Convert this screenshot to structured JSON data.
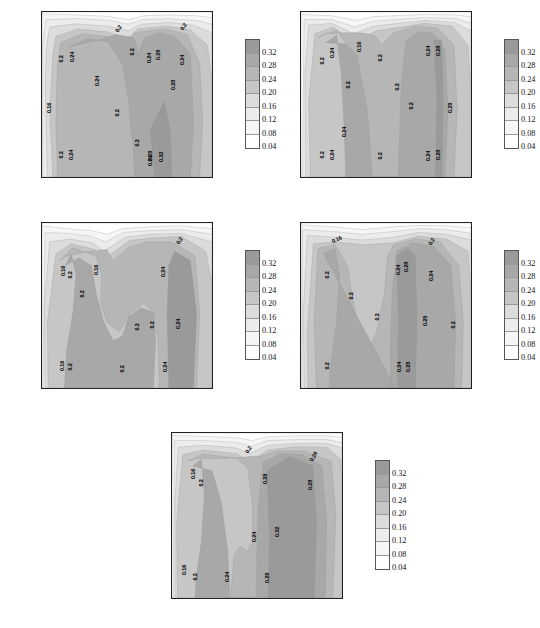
{
  "figure": {
    "panel_count": 5,
    "axis": {
      "ylabel": "土壤深度（cm）",
      "yticks": [
        "-5",
        "-10",
        "-15",
        "-20",
        "-25",
        "-30",
        "-35",
        "-40"
      ],
      "ytick_values": [
        -5,
        -10,
        -15,
        -20,
        -25,
        -30,
        -35,
        -40
      ],
      "xticks": [
        "1",
        "2",
        "3",
        "4",
        "5",
        "6",
        "7",
        "8",
        "9",
        "10",
        "11",
        "12"
      ],
      "xtick_values": [
        1,
        2,
        3,
        4,
        5,
        6,
        7,
        8,
        9,
        10,
        11,
        12
      ]
    },
    "colorbar": {
      "labels": [
        "0.32",
        "0.28",
        "0.24",
        "0.20",
        "0.16",
        "0.12",
        "0.08",
        "0.04"
      ],
      "values": [
        0.32,
        0.28,
        0.24,
        0.2,
        0.16,
        0.12,
        0.08,
        0.04
      ],
      "colors": [
        "#9a9a9a",
        "#a8a8a8",
        "#b6b6b6",
        "#c6c6c6",
        "#dcdcdc",
        "#ececec",
        "#f6f6f6",
        "#ffffff"
      ]
    }
  },
  "chart_data": {
    "type": "heatmap",
    "title": "",
    "xlabel_template": "月份(YYYY年)",
    "ylabel": "土壤深度（cm）",
    "xlim": [
      1,
      12
    ],
    "ylim": [
      -40,
      -5
    ],
    "grid": false,
    "legend": "colorbar-right",
    "variable": "土壤含水量",
    "contour_levels": [
      0.04,
      0.08,
      0.12,
      0.16,
      0.2,
      0.24,
      0.28,
      0.32
    ],
    "panels": [
      {
        "id": "panel-2006",
        "year": "2006",
        "xlabel": "月份(2006年)",
        "contour_labels": [
          {
            "text": "0.2",
            "x": 6.0,
            "y": -8.5,
            "rot": -55
          },
          {
            "text": "0.2",
            "x": 10.2,
            "y": -8.2,
            "rot": -55
          },
          {
            "text": "0.2",
            "x": 2.3,
            "y": -15.0,
            "rot": -90
          },
          {
            "text": "0.24",
            "x": 3.0,
            "y": -14.6,
            "rot": -90
          },
          {
            "text": "0.2",
            "x": 6.9,
            "y": -13.5,
            "rot": -90
          },
          {
            "text": "0.24",
            "x": 8.0,
            "y": -14.8,
            "rot": -90
          },
          {
            "text": "0.28",
            "x": 8.55,
            "y": -14.2,
            "rot": -90
          },
          {
            "text": "0.24",
            "x": 10.1,
            "y": -15.2,
            "rot": -90
          },
          {
            "text": "0.24",
            "x": 4.6,
            "y": -19.6,
            "rot": -90
          },
          {
            "text": "0.28",
            "x": 9.55,
            "y": -20.5,
            "rot": -90
          },
          {
            "text": "0.16",
            "x": 1.5,
            "y": -25.4,
            "rot": -90
          },
          {
            "text": "0.2",
            "x": 5.9,
            "y": -26.4,
            "rot": -90
          },
          {
            "text": "0.2",
            "x": 7.2,
            "y": -32.8,
            "rot": -90
          },
          {
            "text": "0.2",
            "x": 2.3,
            "y": -35.3,
            "rot": -90
          },
          {
            "text": "0.24",
            "x": 2.95,
            "y": -35.3,
            "rot": -90
          },
          {
            "text": "0.28",
            "x": 8.05,
            "y": -35.6,
            "rot": -90
          },
          {
            "text": "0.24",
            "x": 8.05,
            "y": -36.6,
            "rot": -90
          },
          {
            "text": "0.32",
            "x": 8.75,
            "y": -35.8,
            "rot": -90
          }
        ]
      },
      {
        "id": "panel-2007",
        "year": "2007",
        "xlabel": "月份(2007年)",
        "contour_labels": [
          {
            "text": "0.16",
            "x": 4.8,
            "y": -12.4,
            "rot": -90
          },
          {
            "text": "0.2",
            "x": 2.4,
            "y": -15.4,
            "rot": -90
          },
          {
            "text": "0.24",
            "x": 3.05,
            "y": -13.6,
            "rot": -90
          },
          {
            "text": "0.2",
            "x": 6.15,
            "y": -14.8,
            "rot": -90
          },
          {
            "text": "0.24",
            "x": 9.25,
            "y": -13.3,
            "rot": -90
          },
          {
            "text": "0.28",
            "x": 9.95,
            "y": -13.2,
            "rot": -90
          },
          {
            "text": "0.2",
            "x": 4.1,
            "y": -20.5,
            "rot": -90
          },
          {
            "text": "0.2",
            "x": 7.25,
            "y": -21.0,
            "rot": -90
          },
          {
            "text": "0.2",
            "x": 8.2,
            "y": -25.0,
            "rot": -90
          },
          {
            "text": "0.28",
            "x": 10.7,
            "y": -25.4,
            "rot": -90
          },
          {
            "text": "0.24",
            "x": 3.85,
            "y": -30.5,
            "rot": -90
          },
          {
            "text": "0.2",
            "x": 2.45,
            "y": -35.4,
            "rot": -90
          },
          {
            "text": "0.24",
            "x": 3.05,
            "y": -35.3,
            "rot": -90
          },
          {
            "text": "0.2",
            "x": 6.15,
            "y": -35.6,
            "rot": -90
          },
          {
            "text": "0.24",
            "x": 9.25,
            "y": -35.5,
            "rot": -90
          },
          {
            "text": "0.28",
            "x": 9.95,
            "y": -35.4,
            "rot": -90
          }
        ]
      },
      {
        "id": "panel-2008",
        "year": "2008",
        "xlabel": "月份(2008年)",
        "contour_labels": [
          {
            "text": "0.2",
            "x": 9.9,
            "y": -8.8,
            "rot": -55
          },
          {
            "text": "0.16",
            "x": 2.4,
            "y": -15.2,
            "rot": -90
          },
          {
            "text": "0.2",
            "x": 2.9,
            "y": -16.0,
            "rot": -90
          },
          {
            "text": "0.16",
            "x": 4.55,
            "y": -15.0,
            "rot": -90
          },
          {
            "text": "0.24",
            "x": 8.9,
            "y": -15.4,
            "rot": -90
          },
          {
            "text": "0.2",
            "x": 3.65,
            "y": -20.0,
            "rot": -90
          },
          {
            "text": "0.2",
            "x": 7.2,
            "y": -27.0,
            "rot": -90
          },
          {
            "text": "0.2",
            "x": 8.2,
            "y": -26.6,
            "rot": -90
          },
          {
            "text": "0.24",
            "x": 9.85,
            "y": -26.5,
            "rot": -90
          },
          {
            "text": "0.16",
            "x": 2.35,
            "y": -35.4,
            "rot": -90
          },
          {
            "text": "0.2",
            "x": 2.85,
            "y": -35.6,
            "rot": -90
          },
          {
            "text": "0.2",
            "x": 6.25,
            "y": -35.9,
            "rot": -90
          },
          {
            "text": "0.24",
            "x": 9.0,
            "y": -35.5,
            "rot": -90
          }
        ]
      },
      {
        "id": "panel-2009",
        "year": "2009",
        "xlabel": "月份(2009年)",
        "contour_labels": [
          {
            "text": "0.16",
            "x": 3.3,
            "y": -8.6,
            "rot": -25
          },
          {
            "text": "0.2",
            "x": 9.5,
            "y": -9.0,
            "rot": -60
          },
          {
            "text": "0.2",
            "x": 2.75,
            "y": -16.0,
            "rot": -90
          },
          {
            "text": "0.24",
            "x": 7.35,
            "y": -15.0,
            "rot": -90
          },
          {
            "text": "0.28",
            "x": 7.85,
            "y": -14.4,
            "rot": -90
          },
          {
            "text": "0.24",
            "x": 9.45,
            "y": -16.2,
            "rot": -90
          },
          {
            "text": "0.2",
            "x": 4.3,
            "y": -20.5,
            "rot": -90
          },
          {
            "text": "0.2",
            "x": 6.0,
            "y": -25.0,
            "rot": -90
          },
          {
            "text": "0.28",
            "x": 9.1,
            "y": -25.8,
            "rot": -90
          },
          {
            "text": "0.2",
            "x": 10.9,
            "y": -26.6,
            "rot": -90
          },
          {
            "text": "0.2",
            "x": 2.75,
            "y": -35.4,
            "rot": -90
          },
          {
            "text": "0.24",
            "x": 7.4,
            "y": -35.5,
            "rot": -90
          },
          {
            "text": "0.28",
            "x": 8.0,
            "y": -35.5,
            "rot": -90
          }
        ]
      },
      {
        "id": "panel-2010",
        "year": "2010",
        "xlabel": "月份(2010年)",
        "contour_labels": [
          {
            "text": "0.2",
            "x": 5.95,
            "y": -8.5,
            "rot": -55
          },
          {
            "text": "0.24",
            "x": 10.2,
            "y": -10.0,
            "rot": -60
          },
          {
            "text": "0.16",
            "x": 2.45,
            "y": -13.6,
            "rot": -90
          },
          {
            "text": "0.2",
            "x": 2.95,
            "y": -15.6,
            "rot": -90
          },
          {
            "text": "0.28",
            "x": 7.1,
            "y": -14.8,
            "rot": -90
          },
          {
            "text": "0.28",
            "x": 10.0,
            "y": -16.0,
            "rot": -90
          },
          {
            "text": "0.24",
            "x": 6.35,
            "y": -27.0,
            "rot": -90
          },
          {
            "text": "0.32",
            "x": 7.85,
            "y": -26.0,
            "rot": -90
          },
          {
            "text": "0.16",
            "x": 1.85,
            "y": -34.0,
            "rot": -90
          },
          {
            "text": "0.2",
            "x": 2.55,
            "y": -35.6,
            "rot": -90
          },
          {
            "text": "0.24",
            "x": 4.6,
            "y": -35.6,
            "rot": -90
          },
          {
            "text": "0.28",
            "x": 7.2,
            "y": -35.8,
            "rot": -90
          }
        ]
      }
    ]
  }
}
